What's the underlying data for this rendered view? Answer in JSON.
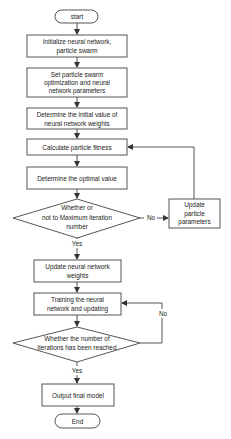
{
  "flowchart": {
    "start": "start",
    "init": [
      "Initialize neural network,",
      "particle swarm"
    ],
    "set_params": [
      "Set particle swarm",
      "optimization and neural",
      "network parameters"
    ],
    "init_weights": [
      "Determine the initial value of",
      "neural network weights"
    ],
    "calc_fitness": "Calculate particle fitness",
    "optimal": "Determine the optimal value",
    "decision1": [
      "Whether or",
      "not to Maximum iteration",
      "number"
    ],
    "update_particle": [
      "Update",
      "particle",
      "parameters"
    ],
    "update_weights": [
      "Update neural network",
      "weights"
    ],
    "training": [
      "Training the neural",
      "network and updating"
    ],
    "decision2": [
      "Whether the number of",
      "iterations has been reached"
    ],
    "output": "Output final model",
    "end": "End",
    "edges": {
      "d1_no": "No",
      "d1_yes": "Yes",
      "d2_no": "No",
      "d2_yes": "Yes"
    }
  },
  "colors": {
    "stroke": "#555555",
    "text": "#222222",
    "background": "#ffffff"
  }
}
